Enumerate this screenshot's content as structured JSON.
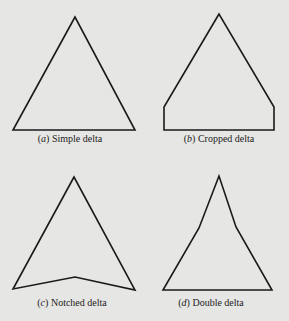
{
  "figure": {
    "panels": [
      {
        "id": "a",
        "label": "a",
        "title": "Simple delta",
        "points": "75,17 13,130 135,130",
        "caption_x": 70,
        "caption_y": 133
      },
      {
        "id": "b",
        "label": "b",
        "title": "Cropped delta",
        "points": "219,14 164,107 164,130 274,130 274,107",
        "caption_x": 219,
        "caption_y": 133
      },
      {
        "id": "c",
        "label": "c",
        "title": "Notched delta",
        "points": "74,177 13,289 75,277 135,290",
        "caption_x": 72,
        "caption_y": 297
      },
      {
        "id": "d",
        "label": "d",
        "title": "Double delta",
        "points": "219,176 199,228 163,290 272,290 236,227",
        "caption_x": 211,
        "caption_y": 297
      }
    ],
    "colors": {
      "background": "#e6e6e4",
      "stroke": "#1a1a1a"
    }
  }
}
